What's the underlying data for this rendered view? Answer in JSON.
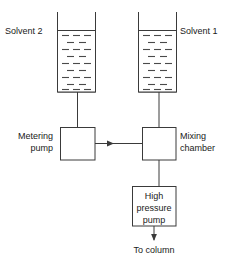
{
  "diagram": {
    "type": "process-flow",
    "background_color": "#ffffff",
    "line_color": "#3a3a3a",
    "text_color": "#1a1a1a"
  },
  "reservoirs": [
    {
      "id": "solvent-2",
      "label": "Solvent 2",
      "label_side": "left",
      "label_x": 5,
      "label_y": 34,
      "beaker": {
        "left": 57,
        "right": 96,
        "top": 12,
        "liquid_top": 30,
        "bottom": 92
      },
      "liquid_rows": 9,
      "dash_color": "#4a4a4a"
    },
    {
      "id": "solvent-1",
      "label": "Solvent 1",
      "label_side": "right",
      "label_x": 180,
      "label_y": 34,
      "beaker": {
        "left": 138,
        "right": 177,
        "top": 12,
        "liquid_top": 30,
        "bottom": 92
      },
      "liquid_rows": 9,
      "dash_color": "#4a4a4a"
    }
  ],
  "boxes": [
    {
      "id": "metering-pump",
      "label_line1": "Metering",
      "label_line2": "pump",
      "label_side": "left",
      "label_x": 53,
      "label_y1": 138,
      "label_y2": 150,
      "rect": {
        "x": 60,
        "y": 127,
        "w": 35,
        "h": 33
      }
    },
    {
      "id": "mixing-chamber",
      "label_line1": "Mixing",
      "label_line2": "chamber",
      "label_side": "right",
      "label_x": 179,
      "label_y1": 138,
      "label_y2": 150,
      "rect": {
        "x": 142,
        "y": 127,
        "w": 34,
        "h": 33
      }
    },
    {
      "id": "high-pressure-pump",
      "label_line1": "High",
      "label_line2": "pressure",
      "label_line3": "pump",
      "label_side": "inside",
      "rect": {
        "x": 132,
        "y": 186,
        "w": 44,
        "h": 40
      }
    }
  ],
  "outlet": {
    "id": "to-column",
    "label": "To column",
    "label_x": 154,
    "label_y": 250
  },
  "connections": [
    {
      "id": "solvent2-to-metering",
      "from": "solvent-2",
      "to": "metering-pump",
      "orientation": "vertical"
    },
    {
      "id": "metering-to-mixing",
      "from": "metering-pump",
      "to": "mixing-chamber",
      "orientation": "horizontal",
      "arrow": true
    },
    {
      "id": "solvent1-to-mixing",
      "from": "solvent-1",
      "to": "mixing-chamber",
      "orientation": "vertical"
    },
    {
      "id": "mixing-to-hpp",
      "from": "mixing-chamber",
      "to": "high-pressure-pump",
      "orientation": "vertical"
    },
    {
      "id": "hpp-to-column",
      "from": "high-pressure-pump",
      "to": "to-column",
      "orientation": "vertical",
      "arrow": true
    }
  ]
}
